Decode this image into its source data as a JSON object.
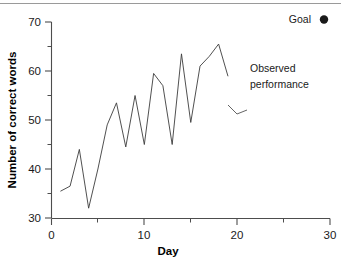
{
  "chart_data": {
    "type": "line",
    "title": "",
    "xlabel": "Day",
    "ylabel": "Number of correct words",
    "xlim": [
      0,
      30
    ],
    "ylim": [
      30,
      70
    ],
    "x_ticks": [
      0,
      10,
      20,
      30
    ],
    "x_tick_labels": [
      "0",
      "10",
      "20",
      "30"
    ],
    "x_minor_ticks": [
      5,
      15,
      25
    ],
    "y_ticks": [
      30,
      40,
      50,
      60,
      70
    ],
    "y_tick_labels": [
      "30",
      "40",
      "50",
      "60",
      "70"
    ],
    "y_minor_ticks": [
      35,
      45,
      55,
      65
    ],
    "grid": false,
    "legend_position": "top-right",
    "series": [
      {
        "name": "Observed performance",
        "marker": "none",
        "color": "#3c3c3c",
        "x": [
          1,
          2,
          3,
          4,
          5,
          6,
          7,
          8,
          9,
          10,
          11,
          12,
          13,
          14,
          15,
          16,
          17,
          18,
          19
        ],
        "values": [
          35.5,
          36.5,
          44,
          32,
          40,
          49,
          53.5,
          44.5,
          55,
          45,
          59.5,
          57,
          45,
          63.5,
          49.5,
          61,
          63,
          65.5,
          59
        ]
      }
    ],
    "legend_entries": [
      {
        "label": "Goal",
        "marker": "filled-circle",
        "color": "#1a1a1a"
      }
    ],
    "annotations": [
      {
        "text_line_1": "Observed",
        "text_line_2": "performance",
        "anchor_x": 19.5,
        "anchor_y": 59.5
      }
    ]
  },
  "axes": {
    "x_axis_label": "Day",
    "y_axis_label": "Number of correct words"
  },
  "legend": {
    "goal_label": "Goal"
  },
  "annotation": {
    "line_1": "Observed",
    "line_2": "performance"
  },
  "ticks": {
    "y": {
      "t70": "70",
      "t60": "60",
      "t50": "50",
      "t40": "40",
      "t30": "30"
    },
    "x": {
      "t0": "0",
      "t10": "10",
      "t20": "20",
      "t30": "30"
    }
  },
  "colors": {
    "line": "#3c3c3c",
    "axis": "#4d4d4d",
    "text": "#1a1a1a",
    "rule": "#9a9a9a"
  }
}
